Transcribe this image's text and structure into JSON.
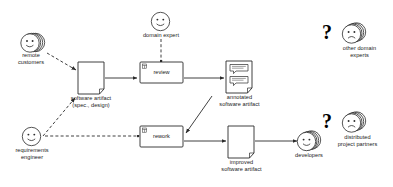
{
  "diagram": {
    "stroke_color": "#2b2b2b",
    "background_color": "#ffffff",
    "text_color": "#1a1a1a"
  },
  "actors": [
    {
      "id": "remote-customers",
      "label": "remote\ncustomers",
      "face": "smile",
      "stacked": true,
      "x": 17,
      "y": 33
    },
    {
      "id": "domain-expert",
      "label": "domain expert",
      "face": "smile",
      "stacked": false,
      "x": 147,
      "y": 12
    },
    {
      "id": "requirements-engineer",
      "label": "requirements\nengineer",
      "face": "smile",
      "stacked": false,
      "x": 19,
      "y": 128
    },
    {
      "id": "other-domain-experts",
      "label": "other domain\nexperts",
      "face": "frown",
      "stacked": true,
      "x": 352,
      "y": 33
    },
    {
      "id": "distributed-partners",
      "label": "distributed\nproject partners",
      "face": "frown",
      "stacked": true,
      "x": 352,
      "y": 122
    },
    {
      "id": "developers",
      "label": "developers",
      "face": "smile",
      "stacked": true,
      "x": 305,
      "y": 142
    }
  ],
  "activities": [
    {
      "id": "review",
      "label": "review",
      "x": 140,
      "y": 62,
      "w": 43,
      "h": 21
    },
    {
      "id": "rework",
      "label": "rework",
      "x": 140,
      "y": 126,
      "w": 43,
      "h": 21
    }
  ],
  "artifacts": [
    {
      "id": "software-artifact",
      "label": "software artifact\n(spec., design)",
      "x": 78,
      "y": 62,
      "w": 26,
      "h": 32,
      "annotated": false
    },
    {
      "id": "annotated-software-artifact",
      "label": "annotated\nsoftware artifact",
      "x": 226,
      "y": 61,
      "w": 26,
      "h": 32,
      "annotated": true
    },
    {
      "id": "improved-software-artifact",
      "label": "improved\nsoftware artifact",
      "x": 228,
      "y": 126,
      "w": 26,
      "h": 32,
      "annotated": false
    }
  ],
  "question_marks": [
    {
      "id": "question-other-domain-experts",
      "text": "?",
      "x": 322,
      "y": 26
    },
    {
      "id": "question-distributed-partners",
      "text": "?",
      "x": 322,
      "y": 115
    }
  ],
  "legend": {
    "solid_flow": "control / object flow",
    "dashed_flow": "participation"
  }
}
